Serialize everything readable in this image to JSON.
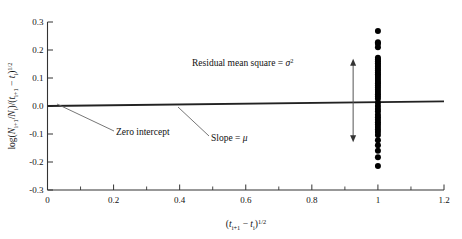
{
  "chart_data": {
    "type": "scatter",
    "title": "",
    "xlabel": "(t_i+1 - t_i)^1/2",
    "ylabel": "log(N_i+1/N_i)/(t_i+1 - t_i)^1/2",
    "xlim": [
      0,
      1.2
    ],
    "ylim": [
      -0.3,
      0.3
    ],
    "grid": false,
    "legend": "none",
    "x_ticks": [
      "0",
      "0.2",
      "0.4",
      "0.6",
      "0.8",
      "1",
      "1.2"
    ],
    "x_tick_values": [
      0,
      0.2,
      0.4,
      0.6,
      0.8,
      1.0,
      1.2
    ],
    "x_minor_values": [
      0.1,
      0.3,
      0.5,
      0.7,
      0.9,
      1.1
    ],
    "y_ticks": [
      "0.3",
      "0.2",
      "0.1",
      "0.0",
      "-0.1",
      "-0.2",
      "-0.3"
    ],
    "y_tick_values": [
      0.3,
      0.2,
      0.1,
      0.0,
      -0.1,
      -0.2,
      -0.3
    ],
    "series": [
      {
        "name": "observations",
        "type": "scatter",
        "marker": "filled-circle",
        "color": "#000000",
        "x": [
          1.0,
          1.0,
          1.0,
          1.0,
          1.0,
          1.0,
          1.0,
          1.0,
          1.0,
          1.0,
          1.0,
          1.0,
          1.0,
          1.0,
          1.0,
          1.0,
          1.0,
          1.0,
          1.0,
          1.0,
          1.0,
          1.0,
          1.0,
          1.0,
          1.0,
          1.0,
          1.0,
          1.0,
          1.0,
          1.0,
          1.0,
          1.0,
          1.0,
          1.0,
          1.0,
          1.0,
          1.0,
          1.0,
          1.0,
          1.0,
          1.0,
          1.0,
          1.0,
          1.0
        ],
        "y": [
          0.268,
          0.228,
          0.222,
          0.21,
          0.172,
          0.166,
          0.16,
          0.153,
          0.146,
          0.14,
          0.133,
          0.127,
          0.12,
          0.113,
          0.107,
          0.1,
          0.093,
          0.086,
          0.08,
          0.073,
          0.066,
          0.058,
          0.05,
          0.042,
          0.034,
          0.026,
          0.012,
          0.0,
          -0.011,
          -0.02,
          -0.031,
          -0.04,
          -0.049,
          -0.058,
          -0.066,
          -0.075,
          -0.084,
          -0.093,
          -0.104,
          -0.122,
          -0.14,
          -0.16,
          -0.183,
          -0.214
        ]
      },
      {
        "name": "regression-line",
        "type": "line",
        "color": "#222222",
        "x": [
          0,
          1.2
        ],
        "y": [
          0.0,
          0.0165
        ]
      }
    ],
    "annotations": [
      {
        "id": "residual-mean-square",
        "text": "Residual mean square = ",
        "symbol": "σ",
        "exponent": "2",
        "x": 0.52,
        "y": 0.215
      },
      {
        "id": "zero-intercept",
        "text": "Zero intercept",
        "x": 0.175,
        "y": 0.095
      },
      {
        "id": "slope",
        "text": "Slope = ",
        "symbol": "μ",
        "x": 0.545,
        "y": 0.063
      },
      {
        "id": "spread-arrow",
        "text": "",
        "x": 0.925,
        "y_top": 0.165,
        "y_bottom": -0.126
      }
    ]
  },
  "axis": {
    "y_label_parts": {
      "log": "log(",
      "N": "N",
      "sub1": "i+1",
      "slash": "/",
      "N2": "N",
      "sub2": "i",
      "close": ")/(",
      "t1": "t",
      "tsub1": "i+1",
      "minus": " − ",
      "t2": "t",
      "tsub2": "i",
      "close2": ")",
      "exp": "1/2"
    },
    "x_label_parts": {
      "open": "(",
      "t1": "t",
      "tsub1": "i+1",
      "minus": " − ",
      "t2": "t",
      "tsub2": "i",
      "close": ")",
      "exp": "1/2"
    }
  },
  "colors": {
    "frame": "#333333",
    "point": "#000000",
    "line": "#222222",
    "annotation_leader": "#666666",
    "background": "#ffffff"
  }
}
